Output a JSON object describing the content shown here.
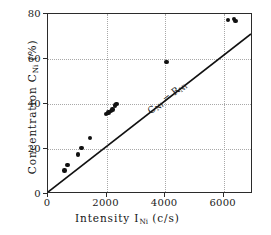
{
  "chart_data": {
    "type": "scatter",
    "title": "",
    "xlabel": "Intensity I_Ni (c/s)",
    "ylabel": "Concentration C_Ni (%)",
    "xlabel_main": "Intensity I",
    "xlabel_sub": "Ni",
    "xlabel_unit": "(c/s)",
    "ylabel_main": "Concentration C",
    "ylabel_sub": "Ni",
    "ylabel_unit": "(%)",
    "xlim": [
      0,
      7000
    ],
    "ylim": [
      0,
      80
    ],
    "xticks": [
      0,
      2000,
      4000,
      6000
    ],
    "xtick_labels": [
      "0",
      "2000",
      "4000",
      "6000"
    ],
    "yticks": [
      0,
      20,
      40,
      60,
      80
    ],
    "ytick_labels": [
      "0",
      "20",
      "40",
      "60",
      "80"
    ],
    "grid": true,
    "grid_style": "dotted",
    "legend": "none",
    "marker": "filled-circle",
    "marker_color": "#111111",
    "points": [
      {
        "x": 560,
        "y": 10.5
      },
      {
        "x": 660,
        "y": 13.0
      },
      {
        "x": 1030,
        "y": 17.5
      },
      {
        "x": 1140,
        "y": 20.5
      },
      {
        "x": 1440,
        "y": 25.0
      },
      {
        "x": 1990,
        "y": 35.6
      },
      {
        "x": 2060,
        "y": 36.2
      },
      {
        "x": 2150,
        "y": 37.0
      },
      {
        "x": 2200,
        "y": 37.6
      },
      {
        "x": 2290,
        "y": 39.3
      },
      {
        "x": 2340,
        "y": 40.0
      },
      {
        "x": 4050,
        "y": 58.8
      },
      {
        "x": 6150,
        "y": 77.3
      },
      {
        "x": 6360,
        "y": 77.8
      },
      {
        "x": 6400,
        "y": 76.8
      }
    ],
    "reference_line": {
      "label": "C_Ni = R_Ni",
      "label_main_1": "C",
      "label_sub_1": "Ni",
      "label_operator": "=",
      "label_main_2": "R",
      "label_sub_2": "Ni",
      "from": {
        "x": 0,
        "y": 0
      },
      "to": {
        "x": 7000,
        "y": 71.0
      },
      "color": "#111111"
    }
  }
}
